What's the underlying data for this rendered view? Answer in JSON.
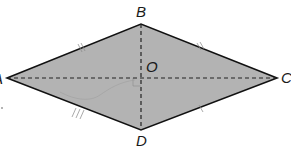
{
  "diagram": {
    "type": "rhombus",
    "fill_color": "#b3b3b3",
    "edge_color": "#111111",
    "diagonal_color": "#222222",
    "vertices": {
      "A": {
        "label": "A",
        "x": 7,
        "y": 78
      },
      "B": {
        "label": "B",
        "x": 141,
        "y": 24
      },
      "C": {
        "label": "C",
        "x": 277,
        "y": 78
      },
      "D": {
        "label": "D",
        "x": 141,
        "y": 130
      }
    },
    "center": {
      "label": "O",
      "x": 141,
      "y": 78
    },
    "edges": [
      "AB",
      "BC",
      "CD",
      "DA"
    ],
    "diagonals": [
      {
        "from": "A",
        "to": "C",
        "style": "dashed"
      },
      {
        "from": "B",
        "to": "D",
        "style": "dashed"
      }
    ]
  }
}
